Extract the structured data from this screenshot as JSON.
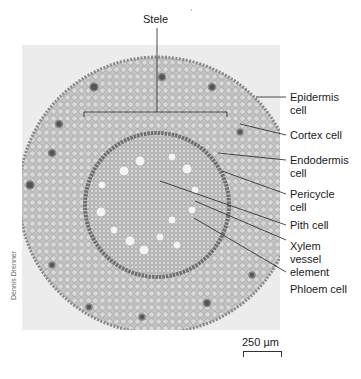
{
  "figure": {
    "credit": "Dennis Drenner",
    "scale_bar": {
      "label": "250 µm"
    },
    "labels": [
      {
        "id": "stele",
        "text": "Stele"
      },
      {
        "id": "epidermis",
        "text": "Epidermis\ncell"
      },
      {
        "id": "cortex",
        "text": "Cortex cell"
      },
      {
        "id": "endodermis",
        "text": "Endodermis\ncell"
      },
      {
        "id": "pericycle",
        "text": "Pericycle\ncell"
      },
      {
        "id": "pith",
        "text": "Pith cell"
      },
      {
        "id": "xylem",
        "text": "Xylem\nvessel\nelement"
      },
      {
        "id": "phloem",
        "text": "Phloem cell"
      }
    ],
    "colors": {
      "background": "#ffffff",
      "photo_background": "#ececec",
      "tissue_outer": "#bdbdbd",
      "tissue_stele": "#cfcfcf",
      "endodermis_ring": "#6f6f6f",
      "leader_line": "#222222"
    }
  }
}
